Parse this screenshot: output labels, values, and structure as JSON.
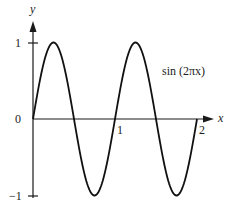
{
  "chart_data": {
    "type": "line",
    "title": "",
    "xlabel": "x",
    "ylabel": "y",
    "xlim": [
      0,
      2
    ],
    "ylim": [
      -1,
      1
    ],
    "grid": false,
    "x_ticks": [
      "1",
      "2"
    ],
    "y_ticks": [
      "1",
      "0",
      "−1"
    ],
    "series": [
      {
        "name": "sin (2πx)",
        "function": "sin(2*pi*x)",
        "x": [
          0,
          0.125,
          0.25,
          0.375,
          0.5,
          0.625,
          0.75,
          0.875,
          1,
          1.125,
          1.25,
          1.375,
          1.5,
          1.625,
          1.75,
          1.875,
          2
        ],
        "values": [
          0,
          0.707,
          1,
          0.707,
          0,
          -0.707,
          -1,
          -0.707,
          0,
          0.707,
          1,
          0.707,
          0,
          -0.707,
          -1,
          -0.707,
          0
        ]
      }
    ],
    "annotations": [
      {
        "text": "sin (2πx)",
        "position": "right of second peak"
      }
    ],
    "colors": {
      "curve": "#111111",
      "axes": "#1a1a1a"
    }
  },
  "labels": {
    "y_axis": "y",
    "x_axis": "x",
    "tick_y_pos1": "1",
    "tick_y_zero": "0",
    "tick_y_neg1": "−1",
    "tick_x_1": "1",
    "tick_x_2": "2",
    "curve_label": "sin (2πx)"
  }
}
